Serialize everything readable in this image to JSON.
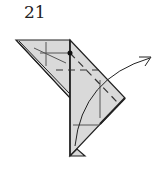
{
  "diagram": {
    "step_number": "21",
    "type": "origami-fold-step",
    "colors": {
      "paper_fill": "#d9d9d9",
      "line": "#222222",
      "background": "#ffffff"
    },
    "elements": [
      "left-flap",
      "main-body",
      "bottom-triangle",
      "crease-lines",
      "dashed-valley-fold-lines",
      "pivot-dot",
      "curved-fold-arrow"
    ]
  }
}
